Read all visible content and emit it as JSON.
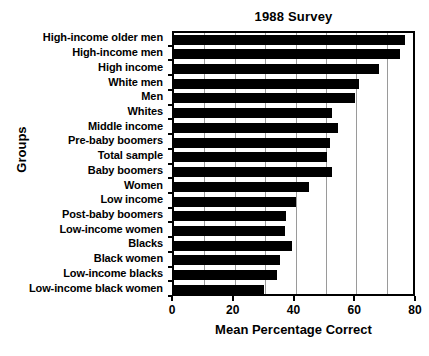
{
  "chart_data": {
    "type": "bar",
    "orientation": "horizontal",
    "title": "1988 Survey",
    "xlabel": "Mean Percentage Correct",
    "ylabel": "Groups",
    "xlim": [
      0,
      80
    ],
    "xticks": [
      0,
      20,
      40,
      60,
      80
    ],
    "xtick_labels": [
      "0",
      "20",
      "40",
      "60",
      "80"
    ],
    "gridlines": [
      10,
      20,
      30,
      40,
      50,
      60,
      70
    ],
    "grid": true,
    "legend": null,
    "bar_color": "#000000",
    "background_color": "#ffffff",
    "categories": [
      "High-income older men",
      "High-income men",
      "High income",
      "White men",
      "Men",
      "Whites",
      "Middle income",
      "Pre-baby boomers",
      "Total sample",
      "Baby boomers",
      "Women",
      "Low income",
      "Post-baby boomers",
      "Low-income women",
      "Blacks",
      "Black women",
      "Low-income blacks",
      "Low-income black women"
    ],
    "values": [
      76,
      74.5,
      67.5,
      61,
      59.5,
      52,
      54,
      51.5,
      50.5,
      52,
      44.5,
      40,
      37,
      36.5,
      39,
      35,
      34,
      29.5
    ]
  },
  "colors": {
    "bar": "#000000",
    "grid": "#9a9a9a",
    "axis": "#000000",
    "text": "#000000"
  }
}
